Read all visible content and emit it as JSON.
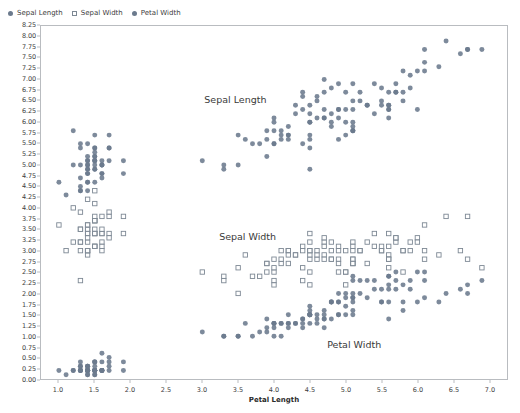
{
  "legend": {
    "position": "top-left",
    "items": [
      {
        "label": "Sepal Length",
        "marker": "filled-circle",
        "color": "#6b7a8d"
      },
      {
        "label": "Sepal Width",
        "marker": "hollow-square",
        "color": "#7d8894"
      },
      {
        "label": "Petal Width",
        "marker": "filled-circle",
        "color": "#6b7a8d"
      }
    ]
  },
  "annotations": [
    {
      "text": "Sepal Length",
      "x": 3.45,
      "y": 6.55
    },
    {
      "text": "Sepal Width",
      "x": 3.62,
      "y": 3.38
    },
    {
      "text": "Petal Width",
      "x": 5.1,
      "y": 0.86
    }
  ],
  "axes": {
    "x": {
      "label": "Petal Length",
      "ticks": [
        "1.0",
        "1.5",
        "2.0",
        "2.5",
        "3.0",
        "3.5",
        "4.0",
        "4.5",
        "5.0",
        "5.5",
        "6.0",
        "6.5",
        "7.0"
      ],
      "min": 0.75,
      "max": 7.25
    },
    "y": {
      "label": "",
      "ticks": [
        "0.00",
        "0.25",
        "0.50",
        "0.75",
        "1.00",
        "1.25",
        "1.50",
        "1.75",
        "2.00",
        "2.25",
        "2.50",
        "2.75",
        "3.00",
        "3.25",
        "3.50",
        "3.75",
        "4.00",
        "4.25",
        "4.50",
        "4.75",
        "5.00",
        "5.25",
        "5.50",
        "5.75",
        "6.00",
        "6.25",
        "6.50",
        "6.75",
        "7.00",
        "7.25",
        "7.50",
        "7.75",
        "8.00",
        "8.25"
      ],
      "min": 0.0,
      "max": 8.25
    }
  },
  "style": {
    "marker_fill": "#6b7a8d",
    "marker_stroke": "#7d8894",
    "frame_color": "#b9bcc0",
    "text_color": "#3d3d3d",
    "background": "#ffffff",
    "grid": false
  },
  "chart_data": {
    "type": "scatter",
    "title": "",
    "xlabel": "Petal Length",
    "ylabel": "",
    "xlim": [
      0.75,
      7.25
    ],
    "ylim": [
      0.0,
      8.25
    ],
    "grid": false,
    "legend_position": "top-left",
    "x": [
      1.4,
      1.4,
      1.3,
      1.5,
      1.4,
      1.7,
      1.4,
      1.5,
      1.4,
      1.5,
      1.5,
      1.6,
      1.4,
      1.1,
      1.2,
      1.5,
      1.3,
      1.4,
      1.7,
      1.5,
      1.7,
      1.5,
      1.0,
      1.7,
      1.9,
      1.6,
      1.6,
      1.5,
      1.4,
      1.6,
      1.6,
      1.5,
      1.5,
      1.4,
      1.5,
      1.2,
      1.3,
      1.4,
      1.3,
      1.5,
      1.3,
      1.3,
      1.3,
      1.6,
      1.9,
      1.4,
      1.6,
      1.4,
      1.5,
      1.4,
      4.7,
      4.5,
      4.9,
      4.0,
      4.6,
      4.5,
      4.7,
      3.3,
      4.6,
      3.9,
      3.5,
      4.2,
      4.0,
      4.7,
      3.6,
      4.4,
      4.5,
      4.1,
      4.5,
      3.9,
      4.8,
      4.0,
      4.9,
      4.7,
      4.3,
      4.4,
      4.8,
      5.0,
      4.5,
      3.5,
      3.8,
      3.7,
      3.9,
      5.1,
      4.5,
      4.5,
      4.7,
      4.4,
      4.1,
      4.0,
      4.4,
      4.6,
      4.0,
      3.3,
      4.2,
      4.2,
      4.2,
      4.3,
      3.0,
      4.1,
      6.0,
      5.1,
      5.9,
      5.6,
      5.8,
      6.6,
      4.5,
      6.3,
      5.8,
      6.1,
      5.1,
      5.3,
      5.5,
      5.0,
      5.1,
      5.3,
      5.5,
      6.7,
      6.9,
      5.0,
      5.7,
      4.9,
      6.7,
      4.9,
      5.7,
      6.0,
      4.8,
      4.9,
      5.6,
      5.8,
      6.1,
      6.4,
      5.6,
      5.1,
      5.6,
      6.1,
      5.6,
      5.5,
      4.8,
      5.4,
      5.6,
      5.1,
      5.1,
      5.9,
      5.7,
      5.2,
      5.0,
      5.2,
      5.4,
      5.1
    ],
    "series": [
      {
        "name": "Sepal Length",
        "marker": "filled-circle",
        "color": "#6b7a8d",
        "values": [
          5.1,
          4.9,
          4.7,
          4.6,
          5.0,
          5.4,
          4.6,
          5.0,
          4.4,
          4.9,
          5.4,
          4.8,
          4.8,
          4.3,
          5.8,
          5.7,
          5.4,
          5.1,
          5.7,
          5.1,
          5.4,
          5.1,
          4.6,
          5.1,
          4.8,
          5.0,
          5.0,
          5.2,
          5.2,
          4.7,
          4.8,
          5.4,
          5.2,
          5.5,
          4.9,
          5.0,
          5.5,
          4.9,
          4.4,
          5.1,
          5.0,
          4.5,
          4.4,
          5.0,
          5.1,
          4.8,
          5.1,
          4.6,
          5.3,
          5.0,
          7.0,
          6.4,
          6.9,
          5.5,
          6.5,
          5.7,
          6.3,
          4.9,
          6.6,
          5.2,
          5.0,
          5.9,
          6.0,
          6.1,
          5.6,
          6.7,
          5.6,
          5.8,
          6.2,
          5.6,
          5.9,
          6.1,
          6.3,
          6.1,
          6.4,
          6.6,
          6.8,
          6.7,
          6.0,
          5.7,
          5.5,
          5.5,
          5.8,
          6.0,
          5.4,
          6.0,
          6.7,
          6.3,
          5.6,
          5.5,
          5.5,
          6.1,
          5.8,
          5.0,
          5.6,
          5.7,
          5.7,
          6.2,
          5.1,
          5.7,
          6.3,
          5.8,
          7.1,
          6.3,
          6.5,
          7.6,
          4.9,
          7.3,
          6.7,
          7.2,
          6.5,
          6.4,
          6.8,
          5.7,
          5.8,
          6.4,
          6.5,
          7.7,
          7.7,
          6.0,
          6.9,
          5.6,
          7.7,
          6.3,
          6.7,
          7.2,
          6.2,
          6.1,
          6.4,
          7.2,
          7.4,
          7.9,
          6.4,
          6.3,
          6.1,
          7.7,
          6.3,
          6.4,
          6.0,
          6.9,
          6.7,
          6.9,
          5.8,
          6.8,
          6.7,
          6.7,
          6.3,
          6.5,
          6.2,
          5.9
        ]
      },
      {
        "name": "Sepal Width",
        "marker": "hollow-square",
        "color": "#7d8894",
        "values": [
          3.5,
          3.0,
          3.2,
          3.1,
          3.6,
          3.9,
          3.4,
          3.4,
          2.9,
          3.1,
          3.7,
          3.4,
          3.0,
          3.0,
          4.0,
          4.4,
          3.9,
          3.5,
          3.8,
          3.8,
          3.4,
          3.7,
          3.6,
          3.3,
          3.4,
          3.0,
          3.4,
          3.5,
          3.4,
          3.2,
          3.1,
          3.4,
          4.1,
          4.2,
          3.1,
          3.2,
          3.5,
          3.6,
          3.0,
          3.4,
          3.5,
          2.3,
          3.2,
          3.5,
          3.8,
          3.0,
          3.8,
          3.2,
          3.7,
          3.3,
          3.2,
          3.2,
          3.1,
          2.3,
          2.8,
          2.8,
          3.3,
          2.4,
          2.9,
          2.7,
          2.0,
          3.0,
          2.2,
          2.9,
          2.9,
          3.1,
          3.0,
          2.7,
          2.2,
          2.5,
          3.2,
          2.8,
          2.5,
          2.8,
          2.9,
          3.0,
          2.8,
          3.0,
          2.9,
          2.6,
          2.4,
          2.4,
          2.7,
          2.7,
          3.0,
          3.4,
          3.1,
          2.3,
          3.0,
          2.5,
          2.6,
          3.0,
          2.6,
          2.3,
          2.7,
          3.0,
          2.9,
          2.9,
          2.5,
          2.8,
          3.3,
          2.7,
          3.0,
          2.9,
          3.0,
          3.0,
          2.5,
          2.9,
          2.5,
          3.6,
          3.2,
          2.7,
          3.0,
          2.5,
          2.8,
          3.2,
          3.0,
          3.8,
          2.6,
          2.2,
          3.2,
          2.8,
          2.8,
          2.7,
          3.3,
          3.2,
          2.8,
          3.0,
          2.8,
          3.0,
          2.8,
          3.8,
          2.8,
          2.8,
          2.6,
          3.0,
          3.4,
          3.1,
          3.0,
          3.1,
          3.1,
          3.1,
          2.7,
          3.2,
          3.3,
          3.0,
          2.5,
          3.0,
          3.4,
          3.0
        ]
      },
      {
        "name": "Petal Width",
        "marker": "filled-circle",
        "color": "#6b7a8d",
        "values": [
          0.2,
          0.2,
          0.2,
          0.2,
          0.2,
          0.4,
          0.3,
          0.2,
          0.2,
          0.1,
          0.2,
          0.2,
          0.1,
          0.1,
          0.2,
          0.4,
          0.4,
          0.3,
          0.3,
          0.3,
          0.2,
          0.4,
          0.2,
          0.5,
          0.2,
          0.2,
          0.4,
          0.2,
          0.2,
          0.2,
          0.2,
          0.4,
          0.1,
          0.2,
          0.2,
          0.2,
          0.2,
          0.1,
          0.2,
          0.2,
          0.3,
          0.3,
          0.2,
          0.6,
          0.4,
          0.3,
          0.2,
          0.2,
          0.2,
          0.2,
          1.4,
          1.5,
          1.5,
          1.3,
          1.5,
          1.3,
          1.6,
          1.0,
          1.3,
          1.4,
          1.0,
          1.5,
          1.0,
          1.4,
          1.3,
          1.4,
          1.5,
          1.0,
          1.5,
          1.1,
          1.8,
          1.3,
          1.5,
          1.2,
          1.3,
          1.4,
          1.4,
          1.7,
          1.5,
          1.0,
          1.1,
          1.0,
          1.2,
          1.6,
          1.5,
          1.6,
          1.5,
          1.3,
          1.3,
          1.3,
          1.2,
          1.4,
          1.2,
          1.0,
          1.3,
          1.2,
          1.3,
          1.3,
          1.1,
          1.3,
          2.5,
          1.9,
          2.1,
          1.8,
          2.2,
          2.1,
          1.7,
          1.8,
          1.8,
          2.5,
          2.0,
          1.9,
          2.1,
          2.0,
          2.4,
          2.3,
          1.8,
          2.2,
          2.3,
          1.5,
          2.3,
          2.0,
          2.0,
          1.8,
          2.1,
          1.8,
          1.8,
          1.8,
          2.1,
          1.6,
          1.9,
          2.0,
          2.2,
          1.5,
          1.4,
          2.3,
          2.4,
          1.8,
          1.8,
          2.1,
          2.4,
          2.3,
          1.9,
          2.3,
          2.5,
          2.3,
          1.9,
          2.0,
          2.3,
          1.8
        ]
      }
    ]
  }
}
